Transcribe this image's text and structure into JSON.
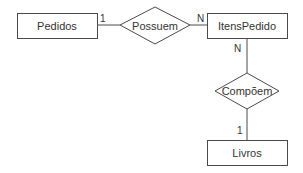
{
  "diagram": {
    "type": "entity-relationship",
    "entities": [
      {
        "id": "pedidos",
        "label": "Pedidos"
      },
      {
        "id": "itens_pedido",
        "label": "ItensPedido"
      },
      {
        "id": "livros",
        "label": "Livros"
      }
    ],
    "relationships": [
      {
        "id": "possuem",
        "label": "Possuem",
        "from": "pedidos",
        "to": "itens_pedido",
        "from_cardinality": "1",
        "to_cardinality": "N"
      },
      {
        "id": "compoem",
        "label": "Compõem",
        "from": "itens_pedido",
        "to": "livros",
        "from_cardinality": "N",
        "to_cardinality": "1"
      }
    ]
  },
  "colors": {
    "stroke": "#4a4a4a",
    "text": "#333333",
    "background": "#ffffff"
  }
}
